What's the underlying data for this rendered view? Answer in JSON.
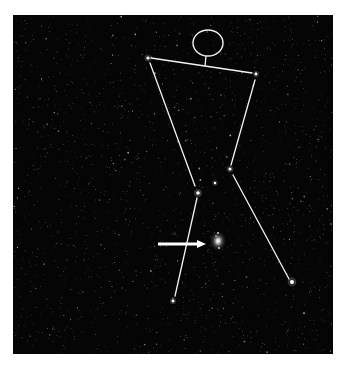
{
  "image": {
    "subject": "Orion constellation star field with stick-figure overlay",
    "background_color": "#ffffff",
    "sky_color": "#050505",
    "line_color": "#f2f2f2",
    "photo_bounds": {
      "x": 13,
      "y": 15,
      "width": 320,
      "height": 339
    }
  },
  "figure": {
    "head": {
      "cx": 208,
      "cy": 43,
      "rx": 15,
      "ry": 13
    },
    "neck": {
      "x1": 206,
      "y1": 56,
      "x2": 205,
      "y2": 66
    },
    "segments": [
      {
        "name": "shoulders",
        "x1": 151,
        "y1": 58,
        "x2": 252,
        "y2": 73
      },
      {
        "name": "left-torso",
        "x1": 150,
        "y1": 63,
        "x2": 195,
        "y2": 186
      },
      {
        "name": "right-torso",
        "x1": 255,
        "y1": 80,
        "x2": 231,
        "y2": 165
      },
      {
        "name": "right-leg",
        "x1": 233,
        "y1": 175,
        "x2": 289,
        "y2": 279
      },
      {
        "name": "left-leg",
        "x1": 197,
        "y1": 198,
        "x2": 175,
        "y2": 296
      }
    ],
    "stars": [
      {
        "name": "betelgeuse-shoulder",
        "x": 148,
        "y": 58,
        "r": 1.6
      },
      {
        "name": "bellatrix-shoulder",
        "x": 256,
        "y": 74,
        "r": 1.4
      },
      {
        "name": "belt-left",
        "x": 198,
        "y": 193,
        "r": 1.8
      },
      {
        "name": "belt-middle",
        "x": 215,
        "y": 183,
        "r": 1.2
      },
      {
        "name": "belt-right",
        "x": 230,
        "y": 169,
        "r": 1.5
      },
      {
        "name": "saiph-foot",
        "x": 173,
        "y": 301,
        "r": 1.4
      },
      {
        "name": "rigel-foot",
        "x": 292,
        "y": 282,
        "r": 2.0
      }
    ]
  },
  "arrow": {
    "x1": 158,
    "y1": 244,
    "x2": 206,
    "y2": 244,
    "head": 9
  },
  "nebula": {
    "name": "orion-nebula",
    "cx": 218,
    "cy": 241,
    "rx": 4.5,
    "ry": 5.5,
    "companions": [
      {
        "x": 218,
        "y": 233,
        "r": 0.9
      },
      {
        "x": 216,
        "y": 236,
        "r": 0.7
      },
      {
        "x": 219,
        "y": 248,
        "r": 0.9
      }
    ]
  },
  "starfield": {
    "seed": 1337,
    "count": 1900
  }
}
